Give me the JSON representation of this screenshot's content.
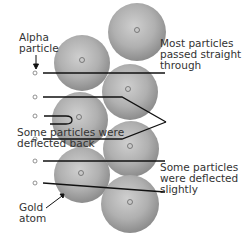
{
  "diagram": {
    "labels": {
      "alpha_particle": [
        "Alpha",
        "particle"
      ],
      "most_straight": [
        "Most particles",
        "passed straight",
        "through"
      ],
      "deflected_back": [
        "Some particles were",
        "deflected back"
      ],
      "deflected_slightly": [
        "Some particles",
        "were deflected",
        "slightly"
      ],
      "gold_atom": [
        "Gold",
        "atom"
      ]
    },
    "colors": {
      "sphere_light": "#d8d8d8",
      "sphere_dark": "#8a8a8a",
      "line": "#111111",
      "text": "#333333"
    }
  }
}
